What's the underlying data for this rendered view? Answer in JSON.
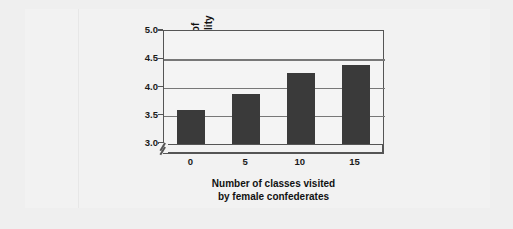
{
  "chart_data": {
    "type": "bar",
    "title": "",
    "xlabel": "Number of classes visited by female confederates",
    "xlabel_lines": [
      "Number of classes visited",
      "by female confederates"
    ],
    "ylabel": "Rating of attractiveness of visitor's personality",
    "ylabel_lines": [
      "Rating of",
      "attractiveness of",
      "visitor's personality"
    ],
    "categories": [
      "0",
      "5",
      "10",
      "15"
    ],
    "values": [
      3.61,
      3.88,
      4.25,
      4.39
    ],
    "ylim": [
      3.0,
      5.0
    ],
    "yticks": [
      "5.0",
      "4.5",
      "4.0",
      "3.5",
      "3.0"
    ],
    "ytick_values": [
      5.0,
      4.5,
      4.0,
      3.5,
      3.0
    ],
    "grid": true,
    "legend": "none",
    "axis_break": "//",
    "bar_color": "#3a3a3a",
    "grid_color": "#777777",
    "frame_color": "#555555",
    "plot_background": "#f4f4f4",
    "page_background": "#efefef"
  }
}
